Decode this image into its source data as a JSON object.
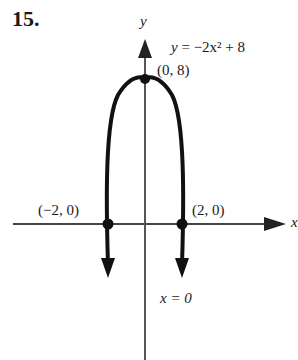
{
  "problem_number": "15.",
  "axes": {
    "x_label": "x",
    "y_label": "y"
  },
  "equation": {
    "lhs": "y",
    "rhs": "= −2x² + 8"
  },
  "points": [
    {
      "label": "(0, 8)",
      "x": 0,
      "y": 8,
      "role": "vertex"
    },
    {
      "label": "(−2, 0)",
      "x": -2,
      "y": 0,
      "role": "x-intercept"
    },
    {
      "label": "(2, 0)",
      "x": 2,
      "y": 0,
      "role": "x-intercept"
    }
  ],
  "axis_of_symmetry": "x = 0",
  "colors": {
    "curve": "#111111",
    "axis": "#444444"
  }
}
